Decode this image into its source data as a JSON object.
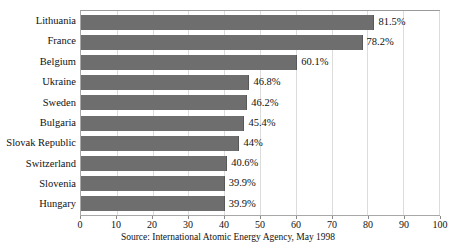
{
  "chart_data": {
    "type": "bar",
    "orientation": "horizontal",
    "title": "",
    "xlabel": "",
    "ylabel": "",
    "xlim": [
      0,
      100
    ],
    "xticks": [
      0,
      10,
      20,
      30,
      40,
      50,
      60,
      70,
      80,
      90,
      100
    ],
    "xtick_labels": [
      "0",
      "10",
      "20",
      "30",
      "40",
      "50",
      "60",
      "70",
      "80",
      "90",
      "100"
    ],
    "grid": true,
    "grid_axis": "x",
    "legend": false,
    "categories": [
      "Lithuania",
      "France",
      "Belgium",
      "Ukraine",
      "Sweden",
      "Bulgaria",
      "Slovak Republic",
      "Switzerland",
      "Slovenia",
      "Hungary"
    ],
    "values": [
      81.5,
      78.2,
      60.1,
      46.8,
      46.2,
      45.4,
      44,
      40.6,
      39.9,
      39.9
    ],
    "data_labels": [
      "81.5%",
      "78.2%",
      "60.1%",
      "46.8%",
      "46.2%",
      "45.4%",
      "44%",
      "40.6%",
      "39.9%",
      "39.9%"
    ],
    "bar_color": "#6e6e6e",
    "grid_color": "#dcdcdc",
    "frame_color": "#a8a8a8"
  },
  "source": {
    "text": "Source: International Atomic Energy Agency, May 1998"
  }
}
